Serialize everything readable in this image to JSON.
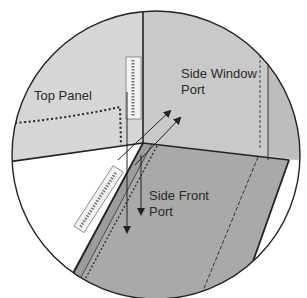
{
  "diagram": {
    "labels": {
      "top_panel": "Top Panel",
      "side_window_port_line1": "Side Window",
      "side_window_port_line2": "Port",
      "side_front_port_line1": "Side Front",
      "side_front_port_line2": "Port"
    },
    "colors": {
      "background": "#ffffff",
      "top_panel_fill": "#d6d6d6",
      "side_window_fill": "#c9c9c9",
      "side_front_fill": "#a9a9a9",
      "outline": "#222222",
      "seal_fill": "#f2f2f2"
    }
  }
}
